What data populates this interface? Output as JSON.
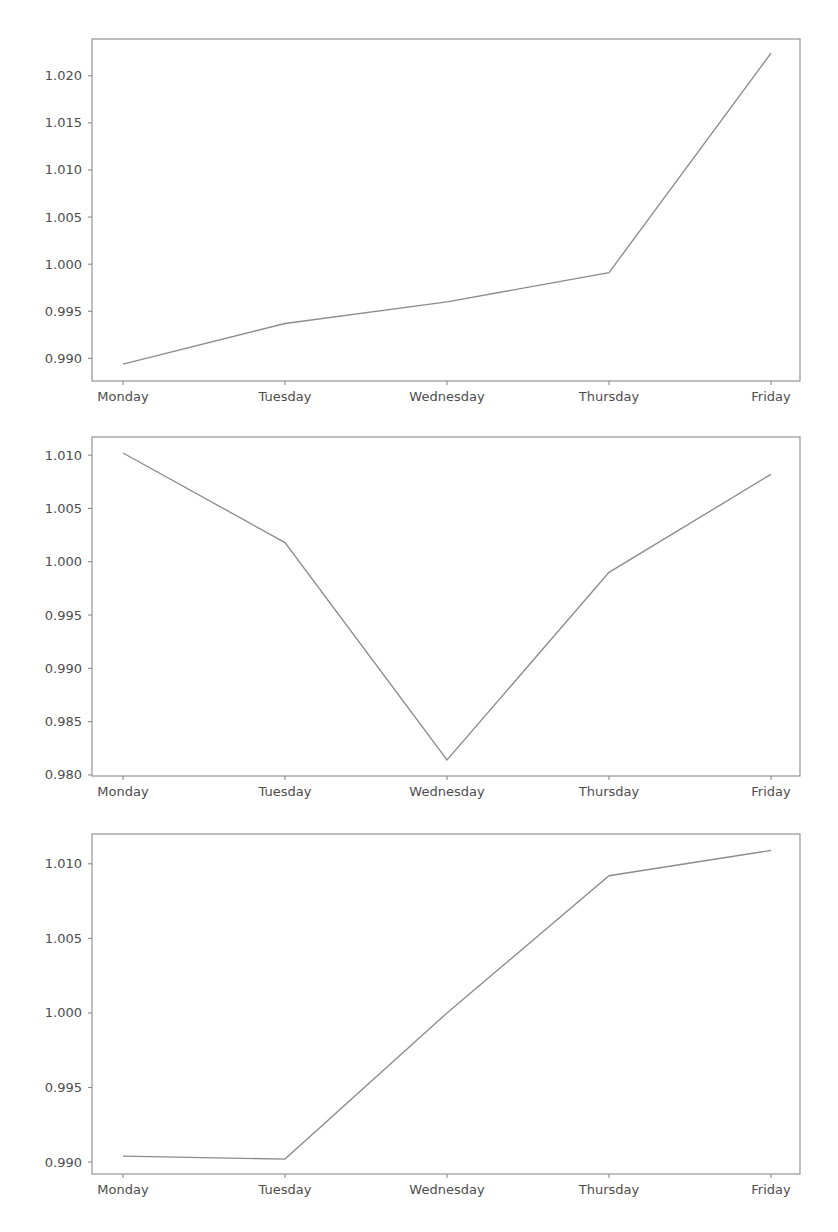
{
  "figure": {
    "width": 838,
    "height": 1232,
    "background": "#ffffff",
    "line_color": "#8c8c8c",
    "axis_color": "#8a8a8a",
    "tick_text_color": "#4d4d4d",
    "subplot_count": 3
  },
  "chart_data": [
    {
      "type": "line",
      "title": "",
      "xlabel": "",
      "ylabel": "",
      "categories": [
        "Monday",
        "Tuesday",
        "Wednesday",
        "Thursday",
        "Friday"
      ],
      "values": [
        0.9894,
        0.9937,
        0.996,
        0.9991,
        1.0224
      ],
      "series": [
        {
          "name": "series-1",
          "values": [
            0.9894,
            0.9937,
            0.996,
            0.9991,
            1.0224
          ]
        }
      ],
      "ylim": [
        0.9876,
        1.0239
      ],
      "yticks": [
        0.99,
        0.995,
        1.0,
        1.005,
        1.01,
        1.015,
        1.02
      ],
      "ytick_labels": [
        "0.990",
        "0.995",
        "1.000",
        "1.005",
        "1.010",
        "1.015",
        "1.020"
      ],
      "xtick_labels": [
        "Monday",
        "Tuesday",
        "Wednesday",
        "Thursday",
        "Friday"
      ],
      "grid": false,
      "legend": null
    },
    {
      "type": "line",
      "title": "",
      "xlabel": "",
      "ylabel": "",
      "categories": [
        "Monday",
        "Tuesday",
        "Wednesday",
        "Thursday",
        "Friday"
      ],
      "values": [
        1.0102,
        1.0018,
        0.9814,
        0.999,
        1.0082
      ],
      "series": [
        {
          "name": "series-2",
          "values": [
            1.0102,
            1.0018,
            0.9814,
            0.999,
            1.0082
          ]
        }
      ],
      "ylim": [
        0.9799,
        1.0117
      ],
      "yticks": [
        0.98,
        0.985,
        0.99,
        0.995,
        1.0,
        1.005,
        1.01
      ],
      "ytick_labels": [
        "0.980",
        "0.985",
        "0.990",
        "0.995",
        "1.000",
        "1.005",
        "1.010"
      ],
      "xtick_labels": [
        "Monday",
        "Tuesday",
        "Wednesday",
        "Thursday",
        "Friday"
      ],
      "grid": false,
      "legend": null
    },
    {
      "type": "line",
      "title": "",
      "xlabel": "",
      "ylabel": "",
      "categories": [
        "Monday",
        "Tuesday",
        "Wednesday",
        "Thursday",
        "Friday"
      ],
      "values": [
        0.9904,
        0.9902,
        1.0,
        1.0092,
        1.0109
      ],
      "series": [
        {
          "name": "series-3",
          "values": [
            0.9904,
            0.9902,
            1.0,
            1.0092,
            1.0109
          ]
        }
      ],
      "ylim": [
        0.9892,
        1.012
      ],
      "yticks": [
        0.99,
        0.995,
        1.0,
        1.005,
        1.01
      ],
      "ytick_labels": [
        "0.990",
        "0.995",
        "1.000",
        "1.005",
        "1.010"
      ],
      "xtick_labels": [
        "Monday",
        "Tuesday",
        "Wednesday",
        "Thursday",
        "Friday"
      ],
      "grid": false,
      "legend": null
    }
  ],
  "geometry": {
    "plot_left": 92,
    "plot_right": 800,
    "xtick_positions": [
      123,
      285,
      447,
      609,
      771
    ],
    "subplots": [
      {
        "top": 39,
        "bottom": 381
      },
      {
        "top": 437,
        "bottom": 776
      },
      {
        "top": 834,
        "bottom": 1174
      }
    ]
  }
}
